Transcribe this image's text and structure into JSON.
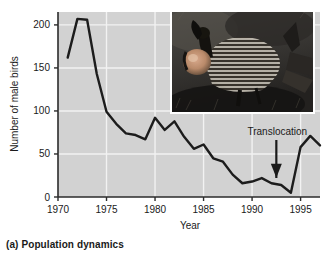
{
  "caption": "(a) Population dynamics",
  "colors": {
    "plot_background": "#d2d2d2",
    "gridline": "#f2f2f2",
    "axis": "#2b2b2b",
    "line": "#1c1c1c",
    "text": "#1a1a1a",
    "photo_border": "#ffffff"
  },
  "photo": {
    "alt_name": "greater-prairie-chicken-photo",
    "description": "Greater prairie chicken male displaying with inflated orange air sac"
  },
  "chart_data": {
    "type": "line",
    "title": "",
    "xlabel": "Year",
    "ylabel": "Number of male birds",
    "xlim": [
      1970,
      1997
    ],
    "ylim": [
      0,
      215
    ],
    "xticks": [
      1970,
      1975,
      1980,
      1985,
      1990,
      1995
    ],
    "yticks": [
      0,
      50,
      100,
      150,
      200
    ],
    "grid": "horizontal-and-vertical-white",
    "legend": "none",
    "annotations": [
      {
        "text": "Translocation",
        "x": 1992.5,
        "y": 20,
        "arrow": "down"
      }
    ],
    "x": [
      1971,
      1972,
      1973,
      1974,
      1975,
      1976,
      1977,
      1978,
      1979,
      1980,
      1981,
      1982,
      1983,
      1984,
      1985,
      1986,
      1987,
      1988,
      1989,
      1990,
      1991,
      1992,
      1993,
      1994,
      1995,
      1996,
      1997
    ],
    "values": [
      162,
      207,
      206,
      143,
      99,
      85,
      74,
      72,
      67,
      92,
      78,
      88,
      70,
      56,
      61,
      45,
      41,
      26,
      16,
      18,
      22,
      16,
      14,
      5,
      58,
      71,
      60
    ],
    "series": [
      {
        "name": "Number of male birds",
        "values": [
          162,
          207,
          206,
          143,
          99,
          85,
          74,
          72,
          67,
          92,
          78,
          88,
          70,
          56,
          61,
          45,
          41,
          26,
          16,
          18,
          22,
          16,
          14,
          5,
          58,
          71,
          60
        ]
      }
    ]
  }
}
